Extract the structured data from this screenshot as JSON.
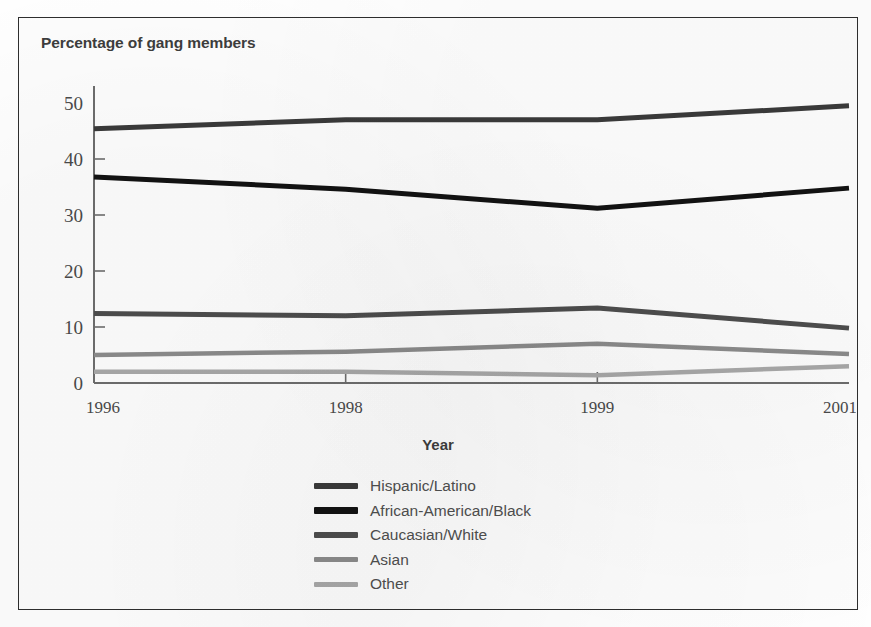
{
  "figure": {
    "title": "Percentage of gang members",
    "x_axis_title": "Year"
  },
  "chart_data": {
    "type": "line",
    "title": "Percentage of gang members",
    "xlabel": "Year",
    "ylabel": "Percentage of gang members",
    "categories": [
      "1996",
      "1998",
      "1999",
      "2001"
    ],
    "x": [
      1996,
      1998,
      1999,
      2001
    ],
    "ylim": [
      0,
      50
    ],
    "yticks": [
      0,
      10,
      20,
      30,
      40,
      50
    ],
    "grid": false,
    "legend_position": "bottom-center",
    "series": [
      {
        "name": "Hispanic/Latino",
        "values": [
          45.4,
          47.0,
          47.0,
          49.5
        ],
        "color": "#3a3a3a",
        "width": 5
      },
      {
        "name": "African-American/Black",
        "values": [
          36.8,
          34.6,
          31.2,
          34.8
        ],
        "color": "#121212",
        "width": 5
      },
      {
        "name": "Caucasian/White",
        "values": [
          12.4,
          12.0,
          13.4,
          9.8
        ],
        "color": "#4d4d4d",
        "width": 5
      },
      {
        "name": "Asian",
        "values": [
          5.0,
          5.6,
          7.0,
          5.2
        ],
        "color": "#8b8b8b",
        "width": 4.5
      },
      {
        "name": "Other",
        "values": [
          2.0,
          2.0,
          1.4,
          3.0
        ],
        "color": "#a8a8a8",
        "width": 4.5
      }
    ]
  },
  "legend": {
    "items": [
      {
        "label": "Hispanic/Latino",
        "color": "#3a3a3a",
        "thickness": "6px"
      },
      {
        "label": "African-American/Black",
        "color": "#121212",
        "thickness": "7px"
      },
      {
        "label": "Caucasian/White",
        "color": "#4d4d4d",
        "thickness": "6px"
      },
      {
        "label": "Asian",
        "color": "#8b8b8b",
        "thickness": "5px"
      },
      {
        "label": "Other",
        "color": "#a8a8a8",
        "thickness": "5px"
      }
    ]
  }
}
